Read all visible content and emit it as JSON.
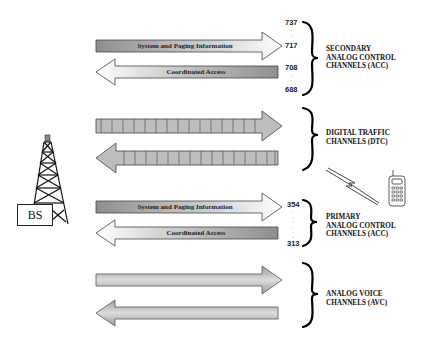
{
  "diagram": {
    "base_station": {
      "label": "BS",
      "icon": "tower-icon"
    },
    "mobile": {
      "icon": "cell-phone-icon",
      "link_icon": "lightning-bolt-icon"
    },
    "colors": {
      "arrow_fill_dark": "#9a9a9a",
      "arrow_fill_light": "#ffffff",
      "stroke": "#333333",
      "text": "#111111"
    },
    "groups": [
      {
        "id": "secondary-acc",
        "label_lines": [
          "SECONDARY",
          "ANALOG CONTROL",
          "CHANNELS (ACC)"
        ],
        "forward_arrow": {
          "label": "System and Paging Information",
          "direction": "right"
        },
        "reverse_arrow": {
          "label": "Coordinated Access",
          "direction": "left"
        },
        "channel_numbers": {
          "forward_top": "737",
          "forward_bottom": "717",
          "reverse_top": "708",
          "reverse_bottom": "688"
        }
      },
      {
        "id": "dtc",
        "label_lines": [
          "DIGITAL TRAFFIC",
          "CHANNELS (DTC)"
        ],
        "forward_arrow": {
          "label": "",
          "direction": "right",
          "style": "segmented"
        },
        "reverse_arrow": {
          "label": "",
          "direction": "left",
          "style": "segmented"
        }
      },
      {
        "id": "primary-acc",
        "label_lines": [
          "PRIMARY",
          "ANALOG CONTROL",
          "CHANNELS (ACC)"
        ],
        "forward_arrow": {
          "label": "System and Paging Information",
          "direction": "right"
        },
        "reverse_arrow": {
          "label": "Coordinated Access",
          "direction": "left"
        },
        "channel_numbers": {
          "top": "354",
          "bottom": "313"
        }
      },
      {
        "id": "avc",
        "label_lines": [
          "ANALOG VOICE",
          "CHANNELS (AVC)"
        ],
        "forward_arrow": {
          "label": "",
          "direction": "right"
        },
        "reverse_arrow": {
          "label": "",
          "direction": "left"
        }
      }
    ]
  }
}
